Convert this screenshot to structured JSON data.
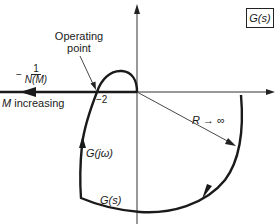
{
  "diagram": {
    "type": "nyquist-plot-describing-function",
    "box_label": "G(s)",
    "labels": {
      "operating_point": [
        "Operating",
        "point"
      ],
      "minus_sign": "−",
      "frac_numerator": "1",
      "frac_denominator": "N(M)",
      "m_increasing_var": "M",
      "m_increasing_text": " increasing",
      "minus_two": "−2",
      "radius": "R → ∞",
      "g_jw": "G(jω)",
      "g_s_bottom": "G(s)"
    },
    "colors": {
      "line": "#1a1a1a",
      "thin_line": "#333333",
      "background": "#ffffff"
    }
  }
}
